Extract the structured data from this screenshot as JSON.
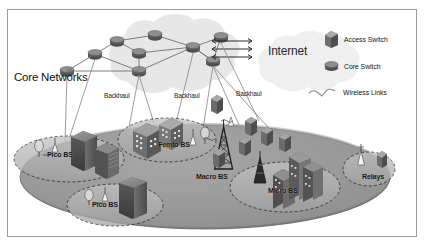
{
  "figure": {
    "type": "network-architecture-diagram",
    "title_visible": false,
    "background": "#ffffff",
    "frame_border_color": "#9a9a9a"
  },
  "labels": {
    "core_networks": "Core Networks",
    "internet": "Internet"
  },
  "backhaul_labels": [
    {
      "text": "Backhaul",
      "x": 104,
      "y": 92
    },
    {
      "text": "Backhaul",
      "x": 174,
      "y": 92
    },
    {
      "text": "Backhaul",
      "x": 236,
      "y": 90
    }
  ],
  "cells": [
    {
      "id": "pico-bs-left",
      "label": "Pico BS",
      "label_x": 47,
      "label_y": 150
    },
    {
      "id": "pico-bs-bottom",
      "label": "Pico BS",
      "label_x": 92,
      "label_y": 200
    },
    {
      "id": "femto-bs",
      "label": "Femto BS",
      "label_x": 158,
      "label_y": 140
    },
    {
      "id": "macro-bs",
      "label": "Macro BS",
      "label_x": 196,
      "label_y": 172
    },
    {
      "id": "micro-bs",
      "label": "Micro BS",
      "label_x": 268,
      "label_y": 186
    },
    {
      "id": "relays",
      "label": "Relays",
      "label_x": 362,
      "label_y": 172
    }
  ],
  "legend": {
    "items": [
      {
        "icon": "access-switch-icon",
        "label": "Access Switch"
      },
      {
        "icon": "core-switch-icon",
        "label": "Core Switch"
      },
      {
        "icon": "wireless-links-icon",
        "label": "Wireless Links"
      }
    ]
  },
  "colors": {
    "macro_ellipse_fill": "#8d8d8d",
    "small_cell_fill": "#b4b4b4",
    "cloud_fill": "#e4e4e4",
    "internet_cloud_fill": "#ededed",
    "switch_dark": "#4a4a4a",
    "switch_mid": "#7d7d7d",
    "line": "#7b7b7b",
    "dashed": "#1f1f1f"
  },
  "topology": {
    "core_switch_count": 9,
    "core_to_internet_links": 3,
    "backhaul_link_count": 6
  }
}
